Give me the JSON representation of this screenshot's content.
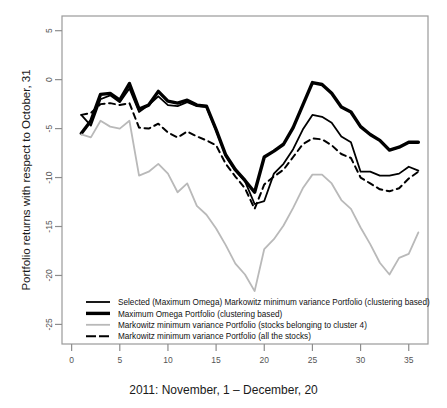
{
  "chart_data": {
    "type": "line",
    "title": "",
    "xlabel": "2011: November, 1 – December, 20",
    "ylabel": "Portfolio returns with respect to October, 31",
    "xlim": [
      -1,
      37
    ],
    "ylim": [
      -27,
      6.5
    ],
    "xticks": [
      0,
      5,
      10,
      15,
      20,
      25,
      30,
      35
    ],
    "yticks": [
      5,
      0,
      -5,
      -10,
      -15,
      -20,
      -25
    ],
    "grid": false,
    "legend_position": "lower-left-inside",
    "x": [
      1,
      2,
      3,
      4,
      5,
      6,
      7,
      8,
      9,
      10,
      11,
      12,
      13,
      14,
      15,
      16,
      17,
      18,
      19,
      20,
      21,
      22,
      23,
      24,
      25,
      26,
      27,
      28,
      29,
      30,
      31,
      32,
      33,
      34,
      35,
      36
    ],
    "series": [
      {
        "name": "Selected (Maximum Omega) Markowitz minimum variance Portfolio (clustering based)",
        "style": "solid-medium-black",
        "color": "#000000",
        "width": 1.8,
        "values": [
          -3.6,
          -4.7,
          -2.0,
          -1.6,
          -2.3,
          -0.9,
          -3.3,
          -2.6,
          -1.7,
          -2.6,
          -2.7,
          -2.3,
          -2.7,
          -2.8,
          -5.2,
          -7.8,
          -9.3,
          -10.4,
          -12.7,
          -12.4,
          -9.6,
          -8.6,
          -7.1,
          -5.1,
          -3.6,
          -3.8,
          -4.4,
          -5.8,
          -6.4,
          -9.4,
          -9.4,
          -9.8,
          -9.8,
          -9.6,
          -8.9,
          -9.3
        ]
      },
      {
        "name": "Maximum Omega Portfolio (clustering based)",
        "style": "solid-thick-black",
        "color": "#000000",
        "width": 3.4,
        "values": [
          -5.5,
          -4.2,
          -1.5,
          -1.4,
          -2.1,
          -0.4,
          -3.0,
          -2.6,
          -1.2,
          -2.2,
          -2.4,
          -2.1,
          -2.6,
          -2.7,
          -5.1,
          -7.7,
          -9.2,
          -10.3,
          -11.5,
          -7.9,
          -7.3,
          -6.6,
          -4.9,
          -2.6,
          -0.3,
          -0.5,
          -1.4,
          -2.8,
          -3.3,
          -4.8,
          -5.6,
          -6.2,
          -7.2,
          -6.9,
          -6.4,
          -6.4
        ]
      },
      {
        "name": "Markowitz minimum variance Portfolio (stocks belonging to cluster 4)",
        "style": "solid-gray",
        "color": "#b9b9b9",
        "width": 1.8,
        "values": [
          -5.6,
          -5.9,
          -4.2,
          -4.8,
          -5.0,
          -4.2,
          -9.8,
          -9.4,
          -8.6,
          -9.6,
          -11.5,
          -10.6,
          -12.9,
          -13.8,
          -15.2,
          -16.9,
          -18.8,
          -19.9,
          -21.6,
          -17.3,
          -16.3,
          -14.9,
          -13.1,
          -11.1,
          -9.7,
          -9.7,
          -10.6,
          -12.3,
          -13.2,
          -15.1,
          -16.8,
          -18.7,
          -19.9,
          -18.2,
          -17.8,
          -15.6
        ]
      },
      {
        "name": "Markowitz minimum variance Portfolio (all the stocks)",
        "style": "dashed-black",
        "color": "#000000",
        "width": 2.0,
        "values": [
          -3.6,
          -3.4,
          -2.5,
          -2.4,
          -2.6,
          -2.4,
          -4.9,
          -5.0,
          -4.5,
          -5.4,
          -5.9,
          -5.3,
          -5.8,
          -6.2,
          -6.7,
          -8.6,
          -9.9,
          -11.1,
          -13.2,
          -10.7,
          -9.9,
          -9.2,
          -7.9,
          -6.6,
          -6.0,
          -6.1,
          -6.7,
          -7.6,
          -8.0,
          -10.0,
          -10.6,
          -11.2,
          -11.4,
          -11.1,
          -10.1,
          -9.4
        ]
      }
    ]
  },
  "legend": {
    "items": [
      {
        "label": "Selected (Maximum Omega) Markowitz minimum variance Portfolio (clustering based)",
        "swatch": "solid-medium-black"
      },
      {
        "label": "Maximum Omega Portfolio (clustering based)",
        "swatch": "solid-thick-black"
      },
      {
        "label": "Markowitz minimum variance Portfolio (stocks belonging to cluster 4)",
        "swatch": "solid-gray"
      },
      {
        "label": "Markowitz minimum variance Portfolio (all the stocks)",
        "swatch": "dashed-black"
      }
    ]
  }
}
